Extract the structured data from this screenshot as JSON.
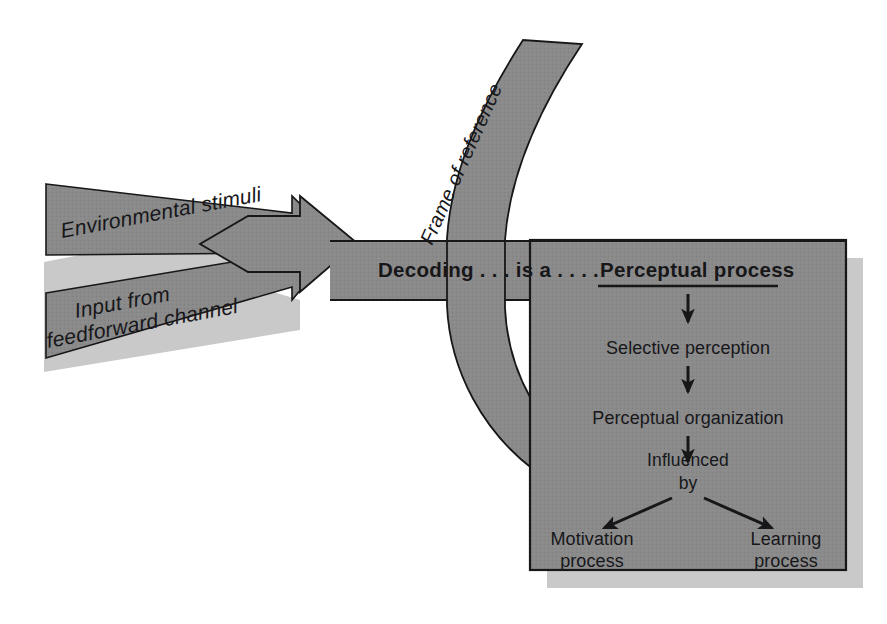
{
  "diagram": {
    "colors": {
      "shape_fill": "#8a8a8a",
      "shadow": "#c9c9c9",
      "outline": "#17171a",
      "text": "#17171a",
      "background": "#ffffff"
    },
    "inputs": [
      {
        "id": "environmental-stimuli",
        "label": "Environmental stimuli",
        "shape": "arrow"
      },
      {
        "id": "input-feedforward",
        "label_line1": "Input from",
        "label_line2": "feedforward channel",
        "shape": "arrow"
      }
    ],
    "curved_band": {
      "id": "frame-of-reference",
      "label": "Frame of reference",
      "shape": "curved-arrow"
    },
    "headline": {
      "prefix": "Decoding . . . is a . . . .",
      "emphasis": "Perceptual process"
    },
    "flow": {
      "steps": [
        {
          "label": "Selective perception"
        },
        {
          "label": "Perceptual organization"
        }
      ],
      "influence_line1": "Influenced",
      "influence_line2": "by",
      "branches": [
        {
          "line1": "Motivation",
          "line2": "process"
        },
        {
          "line1": "Learning",
          "line2": "process"
        }
      ]
    }
  }
}
